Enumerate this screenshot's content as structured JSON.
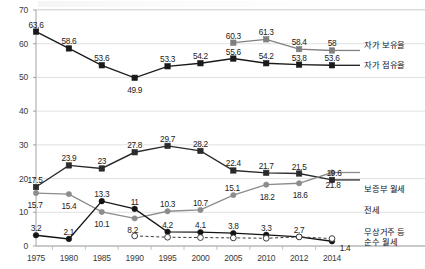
{
  "chart_data": {
    "type": "line",
    "title": "",
    "xlabel": "",
    "ylabel": "",
    "ylim": [
      0,
      70
    ],
    "ytick_step": 10,
    "grid": true,
    "legend_position": "right",
    "categories": [
      "1975",
      "1980",
      "1985",
      "1990",
      "1995",
      "2000",
      "2005",
      "2010",
      "2012",
      "2014"
    ],
    "series": [
      {
        "name": "자가 보유율",
        "color": "#808080",
        "marker": "square",
        "line": "solid",
        "values": [
          null,
          null,
          null,
          null,
          null,
          null,
          60.3,
          61.3,
          58.4,
          58
        ],
        "labels": [
          "",
          "",
          "",
          "",
          "",
          "",
          "60.3",
          "61.3",
          "58.4",
          "58"
        ]
      },
      {
        "name": "자가 점유율",
        "color": "#1a1a1a",
        "marker": "square",
        "line": "solid",
        "values": [
          63.6,
          58.6,
          53.6,
          49.9,
          53.3,
          54.2,
          55.6,
          54.2,
          53.8,
          53.6
        ],
        "labels": [
          "63.6",
          "58.6",
          "53.6",
          "49.9",
          "53.3",
          "54.2",
          "55.6",
          "54.2",
          "53.8",
          "53.6"
        ]
      },
      {
        "name": "보증부 월세",
        "color": "#2b2b2b",
        "marker": "square",
        "line": "solid",
        "values": [
          17.5,
          23.9,
          23,
          27.8,
          29.7,
          28.2,
          22.4,
          21.7,
          21.5,
          19.6
        ],
        "labels": [
          "17.5",
          "23.9",
          "23",
          "27.8",
          "29.7",
          "28.2",
          "22.4",
          "21.7",
          "21.5",
          "19.6"
        ]
      },
      {
        "name": "전세",
        "color": "#8c8c8c",
        "marker": "circle",
        "line": "solid",
        "values": [
          15.7,
          15.4,
          10.1,
          8.2,
          10.3,
          10.7,
          15.1,
          18.2,
          18.6,
          21.8
        ],
        "labels": [
          "15.7",
          "15.4",
          "10.1",
          "8.2",
          "10.3",
          "10.7",
          "15.1",
          "18.2",
          "18.6",
          "21.8"
        ]
      },
      {
        "name": "순수 월세",
        "color": "#141414",
        "marker": "filled-circle",
        "line": "solid",
        "values": [
          3.2,
          2.1,
          13.3,
          11,
          4.2,
          4.1,
          3.8,
          3.3,
          2.7,
          1.4
        ],
        "labels": [
          "3.2",
          "2.1",
          "13.3",
          "11",
          "4.2",
          "4.1",
          "3.8",
          "3.3",
          "2.7",
          "1.4"
        ]
      },
      {
        "name": "무상거주 등",
        "color": "#3d3d3d",
        "marker": "hollow-circle",
        "line": "dashed",
        "values": [
          null,
          null,
          null,
          3.0,
          2.6,
          2.5,
          2.4,
          2.3,
          2.7,
          2.2
        ],
        "labels": [
          "",
          "",
          "",
          "",
          "",
          "",
          "",
          "",
          "",
          ""
        ]
      }
    ],
    "ytick_labels": [
      "0",
      "10",
      "20",
      "30",
      "40",
      "50",
      "60",
      "70"
    ],
    "xtick_labels": [
      "1975",
      "1980",
      "1985",
      "1990",
      "1995",
      "2000",
      "2005",
      "2010",
      "2012",
      "2014"
    ]
  },
  "legend": {
    "entries": [
      {
        "label": "자가 보유율"
      },
      {
        "label": "자가 점유율"
      },
      {
        "label": "보증부 월세"
      },
      {
        "label": "전세"
      },
      {
        "label": "무상거주 등",
        "label2": "순수 월세"
      }
    ]
  }
}
